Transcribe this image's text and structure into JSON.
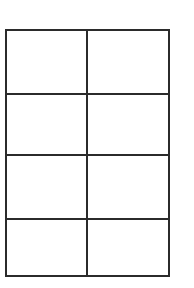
{
  "diagram": {
    "type": "grid",
    "rows": 4,
    "columns": 2,
    "line_color": "#2b2b2b",
    "background": "#ffffff",
    "cells": [
      [
        "",
        ""
      ],
      [
        "",
        ""
      ],
      [
        "",
        ""
      ],
      [
        "",
        ""
      ]
    ]
  }
}
